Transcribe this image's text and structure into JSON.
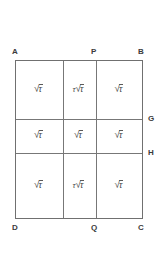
{
  "figure": {
    "type": "geometry-grid-rectangle",
    "rows": 3,
    "columns": 3,
    "vertex_labels": {
      "top_left": "A",
      "top_middle": "P",
      "top_right": "B",
      "right_upper": "G",
      "right_lower": "H",
      "bottom_left": "D",
      "bottom_middle": "Q",
      "bottom_right": "C"
    },
    "cells": [
      [
        {
          "coefficient": "",
          "radicand": "τ"
        },
        {
          "coefficient": "τ",
          "radicand": "τ"
        },
        {
          "coefficient": "",
          "radicand": "τ"
        }
      ],
      [
        {
          "coefficient": "",
          "radicand": "τ"
        },
        {
          "coefficient": "",
          "radicand": "τ"
        },
        {
          "coefficient": "",
          "radicand": "τ"
        }
      ],
      [
        {
          "coefficient": "",
          "radicand": "τ"
        },
        {
          "coefficient": "τ",
          "radicand": "τ"
        },
        {
          "coefficient": "",
          "radicand": "τ"
        }
      ]
    ],
    "radical_sign": "√",
    "colors": {
      "line": "#707070",
      "inner_line": "#777777",
      "text": "#4a4a4a",
      "label": "#3b3b3b",
      "background": "#ffffff"
    }
  }
}
